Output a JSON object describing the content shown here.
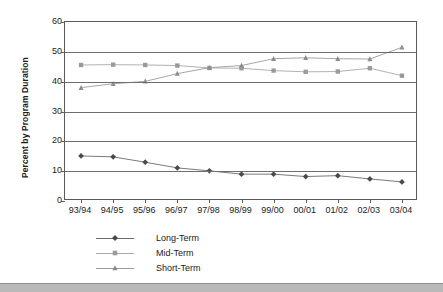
{
  "chart_data": {
    "type": "line",
    "title": "",
    "xlabel": "",
    "ylabel": "Percent by Program Duration",
    "categories": [
      "93/94",
      "94/95",
      "95/96",
      "96/97",
      "97/98",
      "98/99",
      "99/00",
      "00/01",
      "01/02",
      "02/03",
      "03/04"
    ],
    "ylim": [
      0,
      60
    ],
    "ytick_labels": [
      "0",
      "10",
      "20",
      "30",
      "40",
      "50",
      "60"
    ],
    "ytick_values": [
      0,
      10,
      20,
      30,
      40,
      50,
      60
    ],
    "grid": true,
    "legend_position": "bottom-left",
    "series": [
      {
        "name": "Long-Term",
        "marker": "diamond",
        "color": "#4a4a4a",
        "line_color": "#6b6b6b",
        "values": [
          15.1,
          14.8,
          13.0,
          11.1,
          10.1,
          9.0,
          9.0,
          8.2,
          8.5,
          7.4,
          6.4
        ]
      },
      {
        "name": "Mid-Term",
        "marker": "square",
        "color": "#9a9a9a",
        "line_color": "#a8a8a8",
        "values": [
          45.6,
          45.7,
          45.6,
          45.4,
          44.6,
          44.5,
          43.7,
          43.3,
          43.4,
          44.5,
          42.0
        ]
      },
      {
        "name": "Short-Term",
        "marker": "triangle",
        "color": "#8d8d8d",
        "line_color": "#9c9c9c",
        "values": [
          38.0,
          39.3,
          40.1,
          42.7,
          44.7,
          45.4,
          47.7,
          48.0,
          47.7,
          47.6,
          51.5
        ]
      }
    ]
  },
  "legend": {
    "items": [
      {
        "label": "Long-Term"
      },
      {
        "label": "Mid-Term"
      },
      {
        "label": "Short-Term"
      }
    ]
  }
}
